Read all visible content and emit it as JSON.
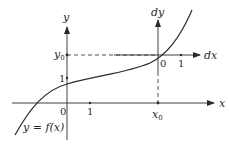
{
  "diagram": {
    "main_axes": {
      "x_label": "x",
      "y_label": "y",
      "origin_label": "0",
      "x_tick_label": "1",
      "y_tick_label": "1"
    },
    "local_axes": {
      "x_label": "dx",
      "y_label": "dy",
      "origin_label": "0",
      "x_tick_label": "1"
    },
    "point": {
      "x_label": "x0",
      "y_label": "y0"
    },
    "curve_label": "y = f(x)",
    "colors": {
      "ink": "#2a2a2a",
      "background": "#ffffff"
    }
  }
}
